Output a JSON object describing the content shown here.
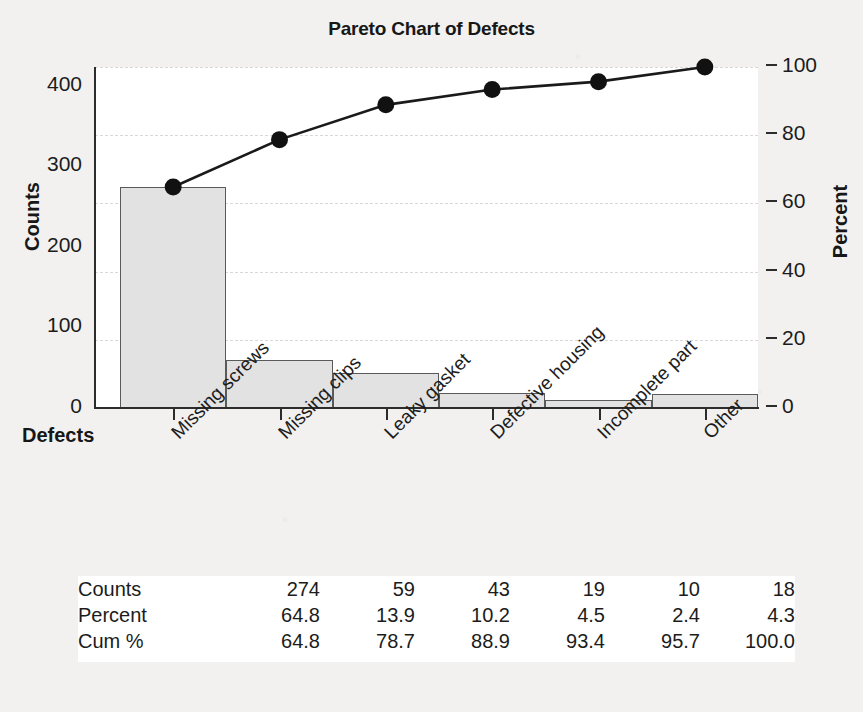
{
  "chart": {
    "title": "Pareto Chart of Defects",
    "x_axis_title": "Defects",
    "y_left_title": "Counts",
    "y_right_title": "Percent"
  },
  "chart_data": {
    "type": "bar",
    "title": "Pareto Chart of Defects",
    "xlabel": "Defects",
    "ylabel": "Counts",
    "y2label": "Percent",
    "grid": true,
    "legend": "none",
    "categories": [
      "Missing screws",
      "Missing clips",
      "Leaky gasket",
      "Defective housing",
      "Incomplete part",
      "Other"
    ],
    "series": [
      {
        "name": "Counts",
        "type": "bar",
        "axis": "left",
        "values": [
          274,
          59,
          43,
          19,
          10,
          18
        ]
      },
      {
        "name": "Cum %",
        "type": "line",
        "axis": "right",
        "values": [
          64.8,
          78.7,
          88.9,
          93.4,
          95.7,
          100.0
        ]
      }
    ],
    "percent": [
      64.8,
      13.9,
      10.2,
      4.5,
      2.4,
      4.3
    ],
    "ylim": [
      0,
      423
    ],
    "y2lim": [
      0,
      100
    ],
    "yticks": [
      0,
      100,
      200,
      300,
      400
    ],
    "y2ticks": [
      0,
      20,
      40,
      60,
      80,
      100
    ]
  },
  "y_left_ticks": [
    "400",
    "300",
    "200",
    "100",
    "0"
  ],
  "y_right_ticks": [
    "100",
    "80",
    "60",
    "40",
    "20",
    "0"
  ],
  "categories": [
    "Missing screws",
    "Missing clips",
    "Leaky gasket",
    "Defective housing",
    "Incomplete part",
    "Other"
  ],
  "summary_table": {
    "rows": [
      {
        "label": "Counts",
        "values": [
          "274",
          "59",
          "43",
          "19",
          "10",
          "18"
        ]
      },
      {
        "label": "Percent",
        "values": [
          "64.8",
          "13.9",
          "10.2",
          "4.5",
          "2.4",
          "4.3"
        ]
      },
      {
        "label": "Cum %",
        "values": [
          "64.8",
          "78.7",
          "88.9",
          "93.4",
          "95.7",
          "100.0"
        ]
      }
    ]
  },
  "colors": {
    "page_background": "#f2f1ef",
    "plot_background": "#ffffff",
    "bar_fill": "#e2e2e2",
    "bar_edge": "#5a5a5a",
    "line": "#1a1a1a",
    "marker": "#111111",
    "axis": "#2c2c2c",
    "grid": "#d8d8d8",
    "text": "#1a1a1a"
  }
}
